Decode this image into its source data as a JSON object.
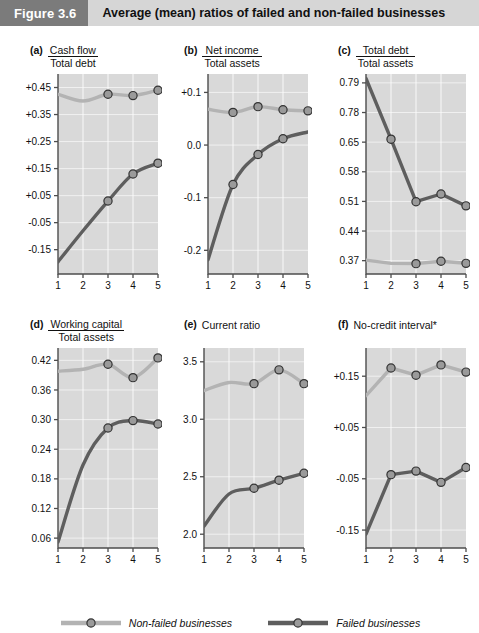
{
  "header": {
    "figure_number": "Figure 3.6",
    "caption": "Average (mean) ratios of failed and non-failed businesses"
  },
  "legend": {
    "position": "bottom-center",
    "items": [
      {
        "label": "Non-failed businesses",
        "color": "#b3b3b3",
        "marker": "circle"
      },
      {
        "label": "Failed businesses",
        "color": "#5e5e5e",
        "marker": "circle"
      }
    ]
  },
  "colors": {
    "non_failed": "#b3b3b3",
    "failed": "#5e5e5e",
    "plot_background": "#d9d9d9",
    "gridline": "#f0f0f0",
    "axis": "#4d4d4d",
    "marker_fill": "#9a9a9a",
    "marker_stroke": "#333333",
    "header_number_bg": "#7b7b7b",
    "header_caption_bg": "#d6d6d6"
  },
  "footnote": "*",
  "chart_data": [
    {
      "id": "a",
      "type": "line",
      "panel_letter": "(a)",
      "title": "Cash flow / Total debt",
      "title_numerator": "Cash flow",
      "title_denominator": "Total debt",
      "xlabel": "",
      "ylabel": "",
      "x": [
        1,
        2,
        3,
        4,
        5
      ],
      "xtick_labels": [
        "1",
        "2",
        "3",
        "4",
        "5"
      ],
      "ytick_labels": [
        "+0.45",
        "+0.35",
        "+0.25",
        "+0.15",
        "+0.05",
        "-0.05",
        "-0.15"
      ],
      "ytick_values": [
        0.45,
        0.35,
        0.25,
        0.15,
        0.05,
        -0.05,
        -0.15
      ],
      "ylim": [
        -0.24,
        0.5
      ],
      "grid": true,
      "series": [
        {
          "name": "Non-failed businesses",
          "color": "#b3b3b3",
          "values": [
            0.425,
            0.4,
            0.425,
            0.42,
            0.44
          ],
          "markers_at": [
            2,
            3,
            4
          ]
        },
        {
          "name": "Failed businesses",
          "color": "#5e5e5e",
          "values": [
            -0.195,
            -0.08,
            0.03,
            0.13,
            0.17
          ],
          "markers_at": [
            2,
            3,
            4
          ]
        }
      ]
    },
    {
      "id": "b",
      "type": "line",
      "panel_letter": "(b)",
      "title": "Net income / Total assets",
      "title_numerator": "Net income",
      "title_denominator": "Total assets",
      "xlabel": "",
      "ylabel": "",
      "x": [
        1,
        2,
        3,
        4,
        5
      ],
      "xtick_labels": [
        "1",
        "2",
        "3",
        "4",
        "5"
      ],
      "ytick_labels": [
        "+0.1",
        "0.0",
        "-0.1",
        "-0.2"
      ],
      "ytick_values": [
        0.1,
        0.0,
        -0.1,
        -0.2
      ],
      "ylim": [
        -0.245,
        0.135
      ],
      "grid": true,
      "series": [
        {
          "name": "Non-failed businesses",
          "color": "#b3b3b3",
          "values": [
            0.068,
            0.062,
            0.073,
            0.067,
            0.065
          ],
          "markers_at": [
            1,
            2,
            3,
            4
          ]
        },
        {
          "name": "Failed businesses",
          "color": "#5e5e5e",
          "values": [
            -0.218,
            -0.075,
            -0.018,
            0.012,
            0.025
          ],
          "markers_at": [
            1,
            2,
            3
          ]
        }
      ]
    },
    {
      "id": "c",
      "type": "line",
      "panel_letter": "(c)",
      "title": "Total debt / Total assets",
      "title_numerator": "Total debt",
      "title_denominator": "Total assets",
      "xlabel": "",
      "ylabel": "",
      "x": [
        1,
        2,
        3,
        4,
        5
      ],
      "xtick_labels": [
        "1",
        "2",
        "3",
        "4",
        "5"
      ],
      "ytick_labels": [
        "0.79",
        "0.78",
        "0.65",
        "0.58",
        "0.51",
        "0.44",
        "0.37"
      ],
      "ytick_values": [
        6,
        5,
        4,
        3,
        2,
        1,
        0
      ],
      "ylim": [
        -0.45,
        6.3
      ],
      "grid": true,
      "series": [
        {
          "name": "Non-failed businesses",
          "color": "#b3b3b3",
          "values": [
            0.02,
            -0.09,
            -0.1,
            -0.02,
            -0.09
          ],
          "markers_at": [
            2,
            3,
            4
          ]
        },
        {
          "name": "Failed businesses",
          "color": "#5e5e5e",
          "values": [
            6.15,
            4.1,
            1.99,
            2.25,
            1.85
          ],
          "markers_at": [
            1,
            2,
            3,
            4
          ]
        }
      ]
    },
    {
      "id": "d",
      "type": "line",
      "panel_letter": "(d)",
      "title": "Working capital / Total assets",
      "title_numerator": "Working capital",
      "title_denominator": "Total assets",
      "xlabel": "",
      "ylabel": "",
      "x": [
        1,
        2,
        3,
        4,
        5
      ],
      "xtick_labels": [
        "1",
        "2",
        "3",
        "4",
        "5"
      ],
      "ytick_labels": [
        "0.42",
        "0.36",
        "0.30",
        "0.24",
        "0.18",
        "0.12",
        "0.06"
      ],
      "ytick_values": [
        0.42,
        0.36,
        0.3,
        0.24,
        0.18,
        0.12,
        0.06
      ],
      "ylim": [
        0.04,
        0.445
      ],
      "grid": true,
      "series": [
        {
          "name": "Non-failed businesses",
          "color": "#b3b3b3",
          "values": [
            0.398,
            0.402,
            0.412,
            0.385,
            0.425
          ],
          "markers_at": [
            2,
            3,
            4
          ]
        },
        {
          "name": "Failed businesses",
          "color": "#5e5e5e",
          "values": [
            0.052,
            0.208,
            0.283,
            0.298,
            0.291
          ],
          "markers_at": [
            2,
            3,
            4
          ]
        }
      ]
    },
    {
      "id": "e",
      "type": "line",
      "panel_letter": "(e)",
      "title": "Current ratio",
      "title_numerator": "",
      "title_denominator": "",
      "xlabel": "",
      "ylabel": "",
      "x": [
        1,
        2,
        3,
        4,
        5
      ],
      "xtick_labels": [
        "1",
        "2",
        "3",
        "4",
        "5"
      ],
      "ytick_labels": [
        "3.5",
        "3.0",
        "2.5",
        "2.0"
      ],
      "ytick_values": [
        3.5,
        3.0,
        2.5,
        2.0
      ],
      "ylim": [
        1.88,
        3.62
      ],
      "grid": true,
      "series": [
        {
          "name": "Non-failed businesses",
          "color": "#b3b3b3",
          "values": [
            3.25,
            3.32,
            3.31,
            3.43,
            3.31
          ],
          "markers_at": [
            2,
            3,
            4
          ]
        },
        {
          "name": "Failed businesses",
          "color": "#5e5e5e",
          "values": [
            2.07,
            2.35,
            2.4,
            2.47,
            2.53
          ],
          "markers_at": [
            2,
            3,
            4
          ]
        }
      ]
    },
    {
      "id": "f",
      "type": "line",
      "panel_letter": "(f)",
      "title": "No-credit interval*",
      "title_numerator": "",
      "title_denominator": "",
      "xlabel": "",
      "ylabel": "",
      "x": [
        1,
        2,
        3,
        4,
        5
      ],
      "xtick_labels": [
        "1",
        "2",
        "3",
        "4",
        "5"
      ],
      "ytick_labels": [
        "+0.15",
        "+0.05",
        "-0.05",
        "-0.15"
      ],
      "ytick_values": [
        0.15,
        0.05,
        -0.05,
        -0.15
      ],
      "ylim": [
        -0.185,
        0.205
      ],
      "grid": true,
      "series": [
        {
          "name": "Non-failed businesses",
          "color": "#b3b3b3",
          "values": [
            0.112,
            0.166,
            0.152,
            0.172,
            0.158
          ],
          "markers_at": [
            1,
            2,
            3,
            4
          ]
        },
        {
          "name": "Failed businesses",
          "color": "#5e5e5e",
          "values": [
            -0.158,
            -0.042,
            -0.035,
            -0.057,
            -0.028
          ],
          "markers_at": [
            1,
            2,
            3,
            4
          ]
        }
      ]
    }
  ]
}
